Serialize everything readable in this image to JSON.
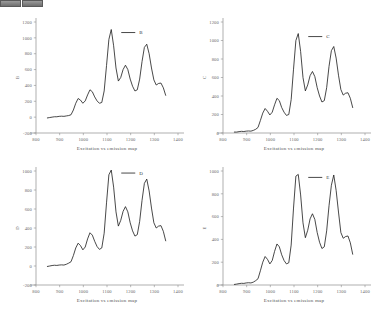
{
  "toolbar": {
    "buttons": [
      {
        "name": "toolbar-chip-1",
        "label": ""
      },
      {
        "name": "toolbar-chip-2",
        "label": ""
      }
    ]
  },
  "figure": {
    "panel_count": 4,
    "line_color": "#1a1a1a",
    "axis_color": "#8d8d8d",
    "background": "#ffffff"
  },
  "chart_data": [
    {
      "type": "line",
      "title": "",
      "legend": "B",
      "legend_position": "top-right-inside",
      "xlabel": "Excitation vs emission map",
      "ylabel": "B",
      "grid": false,
      "xlim": [
        800,
        1400
      ],
      "ylim": [
        -200,
        1200
      ],
      "xticks": [
        800,
        900,
        1000,
        1100,
        1200,
        1300,
        1400
      ],
      "yticks": [
        -200,
        0,
        200,
        400,
        600,
        800,
        1000,
        1200
      ],
      "x": [
        848,
        858,
        868,
        878,
        888,
        898,
        908,
        918,
        928,
        938,
        948,
        958,
        968,
        978,
        988,
        998,
        1008,
        1018,
        1028,
        1038,
        1048,
        1058,
        1068,
        1078,
        1088,
        1098,
        1108,
        1118,
        1128,
        1138,
        1148,
        1158,
        1168,
        1178,
        1188,
        1198,
        1208,
        1218,
        1228,
        1238,
        1248,
        1258,
        1268,
        1278,
        1288,
        1298,
        1308,
        1318,
        1328,
        1338,
        1348
      ],
      "y": [
        -10,
        -5,
        0,
        5,
        5,
        10,
        12,
        10,
        15,
        20,
        30,
        90,
        175,
        235,
        215,
        175,
        205,
        280,
        345,
        320,
        255,
        205,
        175,
        185,
        330,
        650,
        980,
        1105,
        900,
        620,
        455,
        500,
        600,
        655,
        600,
        480,
        390,
        330,
        345,
        480,
        700,
        880,
        920,
        800,
        620,
        470,
        405,
        425,
        430,
        370,
        275
      ]
    },
    {
      "type": "line",
      "title": "",
      "legend": "C",
      "legend_position": "top-right-inside",
      "xlabel": "Excitation vs emission map",
      "ylabel": "C",
      "grid": false,
      "xlim": [
        800,
        1400
      ],
      "ylim": [
        0,
        1200
      ],
      "xticks": [
        800,
        900,
        1000,
        1100,
        1200,
        1300,
        1400
      ],
      "yticks": [
        0,
        200,
        400,
        600,
        800,
        1000,
        1200
      ],
      "x": [
        848,
        858,
        868,
        878,
        888,
        898,
        908,
        918,
        928,
        938,
        948,
        958,
        968,
        978,
        988,
        998,
        1008,
        1018,
        1028,
        1038,
        1048,
        1058,
        1068,
        1078,
        1088,
        1098,
        1108,
        1118,
        1128,
        1138,
        1148,
        1158,
        1168,
        1178,
        1188,
        1198,
        1208,
        1218,
        1228,
        1238,
        1248,
        1258,
        1268,
        1278,
        1288,
        1298,
        1308,
        1318,
        1328,
        1338,
        1348
      ],
      "y": [
        10,
        10,
        15,
        18,
        16,
        20,
        22,
        20,
        28,
        40,
        60,
        135,
        215,
        265,
        235,
        195,
        225,
        305,
        375,
        350,
        275,
        225,
        190,
        200,
        360,
        690,
        1000,
        1075,
        880,
        600,
        455,
        520,
        620,
        665,
        610,
        490,
        400,
        335,
        350,
        490,
        720,
        890,
        935,
        810,
        625,
        470,
        410,
        430,
        435,
        375,
        275
      ]
    },
    {
      "type": "line",
      "title": "",
      "legend": "D",
      "legend_position": "top-right-inside",
      "xlabel": "Excitation vs emission map",
      "ylabel": "D",
      "grid": false,
      "xlim": [
        800,
        1400
      ],
      "ylim": [
        -200,
        1000
      ],
      "xticks": [
        800,
        900,
        1000,
        1100,
        1200,
        1300,
        1400
      ],
      "yticks": [
        -200,
        0,
        200,
        400,
        600,
        800,
        1000
      ],
      "x": [
        848,
        858,
        868,
        878,
        888,
        898,
        908,
        918,
        928,
        938,
        948,
        958,
        968,
        978,
        988,
        998,
        1008,
        1018,
        1028,
        1038,
        1048,
        1058,
        1068,
        1078,
        1088,
        1098,
        1108,
        1118,
        1128,
        1138,
        1148,
        1158,
        1168,
        1178,
        1188,
        1198,
        1208,
        1218,
        1228,
        1238,
        1248,
        1258,
        1268,
        1278,
        1288,
        1298,
        1308,
        1318,
        1328,
        1338,
        1348
      ],
      "y": [
        -5,
        0,
        5,
        8,
        6,
        10,
        12,
        10,
        18,
        30,
        45,
        110,
        190,
        240,
        215,
        170,
        200,
        285,
        350,
        325,
        260,
        205,
        175,
        190,
        345,
        665,
        960,
        1010,
        830,
        570,
        420,
        480,
        575,
        625,
        570,
        455,
        370,
        315,
        330,
        470,
        690,
        870,
        915,
        790,
        610,
        455,
        400,
        420,
        425,
        365,
        265
      ]
    },
    {
      "type": "line",
      "title": "",
      "legend": "E",
      "legend_position": "top-right-inside",
      "xlabel": "Excitation vs emission map",
      "ylabel": "E",
      "grid": false,
      "xlim": [
        800,
        1400
      ],
      "ylim": [
        0,
        1000
      ],
      "xticks": [
        800,
        900,
        1000,
        1100,
        1200,
        1300,
        1400
      ],
      "yticks": [
        0,
        200,
        400,
        600,
        800,
        1000
      ],
      "x": [
        848,
        858,
        868,
        878,
        888,
        898,
        908,
        918,
        928,
        938,
        948,
        958,
        968,
        978,
        988,
        998,
        1008,
        1018,
        1028,
        1038,
        1048,
        1058,
        1068,
        1078,
        1088,
        1098,
        1108,
        1118,
        1128,
        1138,
        1148,
        1158,
        1168,
        1178,
        1188,
        1198,
        1208,
        1218,
        1228,
        1238,
        1248,
        1258,
        1268,
        1278,
        1288,
        1298,
        1308,
        1318,
        1328,
        1338,
        1348
      ],
      "y": [
        5,
        8,
        12,
        15,
        14,
        18,
        20,
        18,
        25,
        38,
        55,
        125,
        200,
        250,
        225,
        185,
        215,
        295,
        360,
        335,
        265,
        215,
        185,
        195,
        350,
        675,
        955,
        970,
        790,
        545,
        415,
        480,
        580,
        625,
        575,
        460,
        375,
        320,
        335,
        475,
        695,
        875,
        965,
        830,
        640,
        460,
        410,
        425,
        430,
        370,
        270
      ]
    }
  ]
}
